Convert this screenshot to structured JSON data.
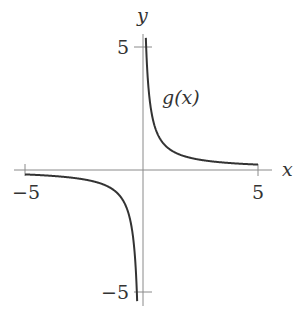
{
  "chart_data": {
    "type": "line",
    "title": "",
    "function_label": "g(x)",
    "xlabel": "x",
    "ylabel": "y",
    "xlim": [
      -5,
      5
    ],
    "ylim": [
      -5.5,
      5.5
    ],
    "x_ticks": [
      -5,
      5
    ],
    "x_tick_labels": [
      "−5",
      "5"
    ],
    "y_ticks": [
      5,
      -5
    ],
    "y_tick_labels": [
      "5",
      "−5"
    ],
    "grid": false,
    "legend": null,
    "series": [
      {
        "name": "g(x)",
        "formula": "1/x",
        "x": [
          -5,
          -4,
          -3,
          -2,
          -1,
          -0.5,
          -0.3,
          -0.2,
          0.2,
          0.3,
          0.5,
          1,
          2,
          3,
          4,
          5
        ],
        "y": [
          -0.2,
          -0.25,
          -0.33,
          -0.5,
          -1,
          -2,
          -3.33,
          -5,
          5,
          3.33,
          2,
          1,
          0.5,
          0.33,
          0.25,
          0.2
        ]
      }
    ],
    "asymptotes": {
      "vertical": 0,
      "horizontal": 0
    },
    "colors": {
      "axis": "#888888",
      "curve": "#333333",
      "text": "#333333"
    }
  }
}
